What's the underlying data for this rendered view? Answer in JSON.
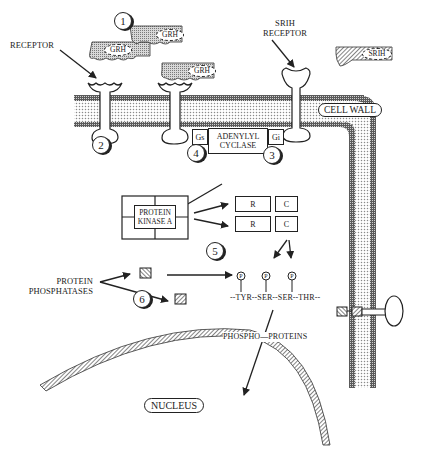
{
  "labels": {
    "receptor": "RECEPTOR",
    "srih_receptor_line1": "SRIH",
    "srih_receptor_line2": "RECEPTOR",
    "cell_wall": "CELL WALL",
    "gs": "Gs",
    "gi": "Gi",
    "adenylyl_cyclase_line1": "ADENYLYL",
    "adenylyl_cyclase_line2": "CYCLASE",
    "protein_kinase_a_line1": "PROTEIN",
    "protein_kinase_a_line2": "KINASE A",
    "protein_phosphatases_line1": "PROTEIN",
    "protein_phosphatases_line2": "PHOSPHATASES",
    "amino_acid_chain": "--TYR--SER--SER--THR--",
    "phosphoproteins": "PHOSPHO—PROTEINS",
    "nucleus": "NUCLEUS"
  },
  "ligands": [
    {
      "label": "GRH"
    },
    {
      "label": "GRH"
    },
    {
      "label": "GRH"
    },
    {
      "label": "SRIH"
    }
  ],
  "subunits": [
    {
      "label": "R"
    },
    {
      "label": "C"
    },
    {
      "label": "R"
    },
    {
      "label": "C"
    }
  ],
  "phosphate_label": "P",
  "step_numbers": [
    "1",
    "2",
    "3",
    "4",
    "5",
    "6"
  ],
  "colors": {
    "ink": "#222222",
    "membrane_dots": "#bdbdbd",
    "membrane_edge": "#4a4a4a",
    "background": "#ffffff"
  }
}
